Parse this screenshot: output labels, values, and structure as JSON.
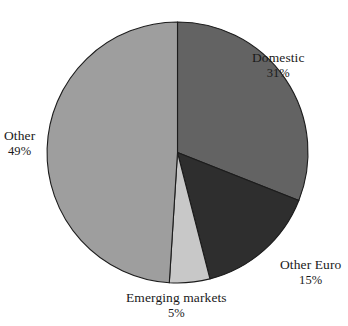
{
  "chart_data": {
    "type": "pie",
    "title": "",
    "categories": [
      "Domestic",
      "Other Euro",
      "Emerging markets",
      "Other"
    ],
    "values": [
      31,
      15,
      5,
      49
    ],
    "value_suffix": "%",
    "slice_colors": [
      "#636363",
      "#2e2e2e",
      "#c8c8c8",
      "#9e9e9e"
    ],
    "stroke_color": "#1c1c1c",
    "background": "#ffffff",
    "start_angle_deg": 0,
    "direction": "clockwise",
    "legend": "none",
    "labels_position": "outside",
    "slices": [
      {
        "label": "Domestic",
        "value": 31,
        "value_text": "31%",
        "color": "#636363"
      },
      {
        "label": "Other Euro",
        "value": 15,
        "value_text": "15%",
        "color": "#2e2e2e"
      },
      {
        "label": "Emerging markets",
        "value": 5,
        "value_text": "5%",
        "color": "#c8c8c8"
      },
      {
        "label": "Other",
        "value": 49,
        "value_text": "49%",
        "color": "#9e9e9e"
      }
    ]
  },
  "labels": {
    "domestic": {
      "name": "Domestic",
      "value": "31%"
    },
    "other_euro": {
      "name": "Other Euro",
      "value": "15%"
    },
    "emerging": {
      "name": "Emerging markets",
      "value": "5%"
    },
    "other": {
      "name": "Other",
      "value": "49%"
    }
  }
}
